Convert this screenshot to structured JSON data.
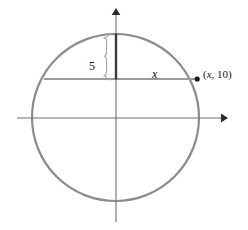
{
  "figure": {
    "background_color": "#ffffff",
    "colors": {
      "circle_stroke": "#8c8c8c",
      "axis_stroke": "#6e6e6e",
      "chord_stroke": "#9a9a9a",
      "segment_stroke": "#3a3a3a",
      "brace_stroke": "#a5a5a5",
      "point_fill": "#1a1a1a",
      "text": "#141414"
    },
    "geometry": {
      "center_x": 115.5,
      "center_y": 117.5,
      "radius": 84,
      "chord_y": 79,
      "chord_left_x": 44,
      "chord_right_x": 196,
      "segment_top_y": 34,
      "segment_bottom_y": 79,
      "x_axis_y": 118,
      "x_axis_left": 17,
      "x_axis_right": 226,
      "y_axis_x": 116,
      "y_axis_top": 10,
      "y_axis_bottom": 222
    }
  },
  "labels": {
    "radius_label": "5",
    "chord_label": "x",
    "point_label_open": "(",
    "point_label_var": "x",
    "point_label_rest": ", 10)"
  },
  "icons": {
    "x_axis_arrow": "arrow-right-icon",
    "y_axis_arrow": "arrow-up-icon",
    "brace": "brace-icon",
    "point": "point-dot-icon"
  }
}
